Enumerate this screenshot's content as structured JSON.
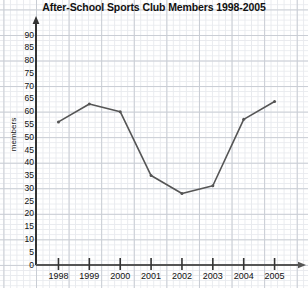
{
  "chart_data": {
    "type": "line",
    "title": "After-School Sports Club Members 1998-2005",
    "xlabel": "",
    "ylabel": "members",
    "categories": [
      "1998",
      "1999",
      "2000",
      "2001",
      "2002",
      "2003",
      "2004",
      "2005"
    ],
    "values": [
      56,
      63,
      60,
      35,
      28,
      31,
      57,
      64
    ],
    "series": [
      {
        "name": "members",
        "values": [
          56,
          63,
          60,
          35,
          28,
          31,
          57,
          64
        ]
      }
    ],
    "ylim": [
      0,
      90
    ],
    "ytick_labels": [
      "0",
      "5",
      "10",
      "15",
      "20",
      "25",
      "30",
      "35",
      "40",
      "45",
      "50",
      "55",
      "60",
      "65",
      "70",
      "75",
      "80",
      "85",
      "90"
    ],
    "ytick_values": [
      0,
      5,
      10,
      15,
      20,
      25,
      30,
      35,
      40,
      45,
      50,
      55,
      60,
      65,
      70,
      75,
      80,
      85,
      90
    ],
    "xtick_labels": [
      "1998",
      "1999",
      "2000",
      "2001",
      "2002",
      "2003",
      "2004",
      "2005"
    ],
    "grid": true,
    "grid_style": "graph-paper",
    "legend": null,
    "legend_position": "none",
    "line_color": "#555555",
    "axis_color": "#333333",
    "grid_color": "#c9cdd4",
    "minor_grid_color": "#e8eaee",
    "background_color": "#ffffff",
    "marker": "dot",
    "axis_arrows": true
  }
}
